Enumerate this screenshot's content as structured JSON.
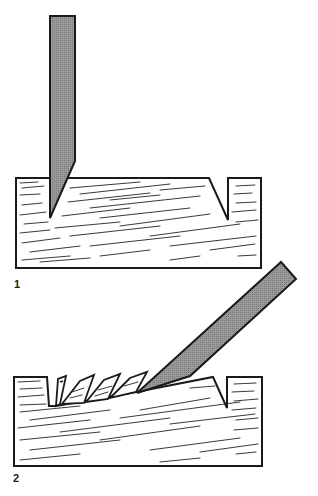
{
  "figures": [
    {
      "label": "1",
      "description": "Chisel held vertically, bevel cutting into wood beside a V-notch",
      "chisel_color": "#8c8c8c"
    },
    {
      "label": "2",
      "description": "Chisel angled, paring chips from wood toward V-notch",
      "chisel_color": "#8c8c8c"
    }
  ],
  "colors": {
    "ink": "#1a1a1a",
    "chisel_fill": "#8c8c8c",
    "background": "#ffffff"
  }
}
